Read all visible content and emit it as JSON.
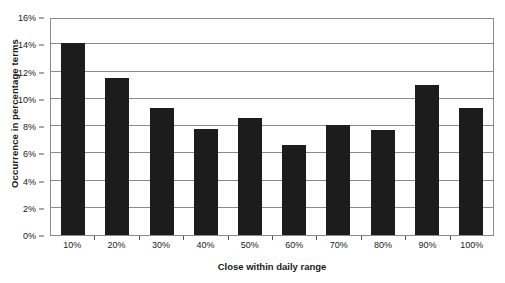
{
  "chart_data": {
    "type": "bar",
    "title": "",
    "xlabel": "Close within daily range",
    "ylabel": "Occurrence in percentage terms",
    "categories": [
      "10%",
      "20%",
      "30%",
      "40%",
      "50%",
      "60%",
      "70%",
      "80%",
      "90%",
      "100%"
    ],
    "values": [
      14.1,
      11.5,
      9.3,
      7.8,
      8.6,
      6.6,
      8.1,
      7.7,
      11.0,
      9.3
    ],
    "ylim": [
      0,
      16
    ],
    "ytick_values": [
      0,
      2,
      4,
      6,
      8,
      10,
      12,
      14,
      16
    ],
    "ytick_labels": [
      "0%",
      "2%",
      "4%",
      "6%",
      "8%",
      "10%",
      "12%",
      "14%",
      "16%"
    ],
    "grid": true,
    "legend": "none",
    "bar_color": "#1c1c1c",
    "plot_border_color": "#8a8a8a",
    "background_color": "#ffffff"
  }
}
